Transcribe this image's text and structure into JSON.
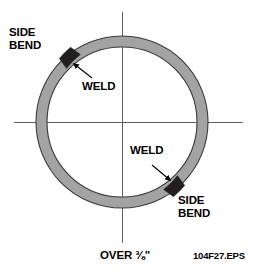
{
  "figure": {
    "eps_id": "104F27.EPS",
    "thickness_note": "OVER",
    "thickness_fraction": "⅜\"",
    "thickness_full": "OVER ⅜\"",
    "colors": {
      "ring_fill": "#a3a3a3",
      "ring_outline": "#3a3a3a",
      "weld_block": "#231f20",
      "centerline": "#6b6b6b",
      "background": "#ffffff",
      "text": "#000000"
    },
    "geometry": {
      "center_x": 122,
      "center_y": 122,
      "outer_radius": 86,
      "inner_radius": 75,
      "horizontal_line_x1": 14,
      "horizontal_line_x2": 243,
      "vertical_line_y1": 12,
      "vertical_line_y2": 243
    }
  },
  "labels": {
    "side_bend_top": {
      "line1": "SIDE",
      "line2": "BEND"
    },
    "side_bend_bottom": {
      "line1": "SIDE",
      "line2": "BEND"
    },
    "weld_top": "WELD",
    "weld_bottom": "WELD"
  },
  "welds": [
    {
      "name": "upper-left-weld",
      "angle_degrees": 137,
      "arc_span_degrees": 11
    },
    {
      "name": "lower-right-weld",
      "angle_degrees": -43,
      "arc_span_degrees": 11
    }
  ]
}
